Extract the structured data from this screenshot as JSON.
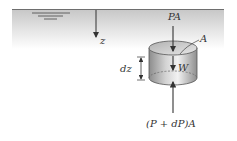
{
  "diagram": {
    "labels": {
      "depth_axis": "z",
      "top_force": "PA",
      "area": "A",
      "weight": "W",
      "height": "dz",
      "bottom_force": "(P + dP)A"
    },
    "colors": {
      "surface_line": "#6e6e6e",
      "fluid_gradient_top": "#c9c9c9",
      "fluid_gradient_bottom": "#ffffff",
      "cylinder_dark": "#8a8a8a",
      "cylinder_light": "#eeeeee",
      "arrow": "#333333"
    },
    "elements": [
      {
        "name": "free-surface",
        "type": "line"
      },
      {
        "name": "free-surface-symbol",
        "type": "triple-line"
      },
      {
        "name": "depth-arrow",
        "type": "arrow",
        "direction": "down",
        "label": "z"
      },
      {
        "name": "fluid-element",
        "type": "cylinder"
      },
      {
        "name": "top-force-arrow",
        "type": "arrow",
        "direction": "down",
        "label": "PA"
      },
      {
        "name": "weight-arrow",
        "type": "arrow",
        "direction": "down",
        "label": "W"
      },
      {
        "name": "bottom-force-arrow",
        "type": "arrow",
        "direction": "up",
        "label": "(P + dP)A"
      },
      {
        "name": "height-dimension",
        "type": "dimension",
        "label": "dz"
      },
      {
        "name": "area-leader",
        "type": "leader",
        "label": "A"
      }
    ]
  }
}
